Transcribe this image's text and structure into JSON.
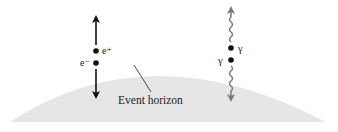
{
  "diagram": {
    "horizon_label": "Event horizon",
    "colors": {
      "background": "#ffffff",
      "horizon_fill": "#e6e6e6",
      "electron_arrow": "#111111",
      "photon_arrow": "#7a7a7a",
      "text": "#222222"
    },
    "pairs": [
      {
        "type": "electron-positron",
        "outer_particle": "e⁺",
        "inner_particle": "e⁻",
        "arrow_style": "straight"
      },
      {
        "type": "photon-photon",
        "outer_particle": "γ",
        "inner_particle": "γ",
        "arrow_style": "wavy"
      }
    ]
  }
}
